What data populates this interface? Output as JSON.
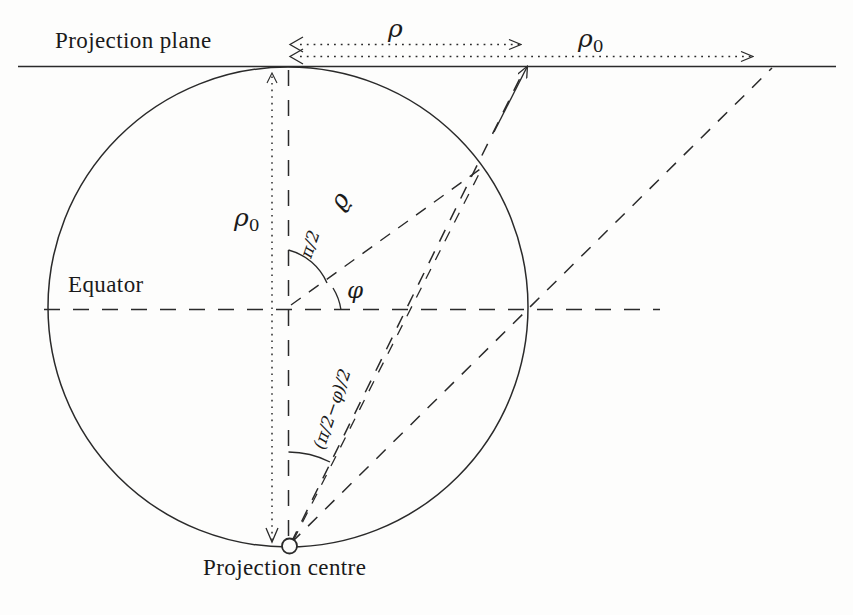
{
  "figure": {
    "labels": {
      "projection_plane": "Projection plane",
      "equator": "Equator",
      "projection_centre": "Projection centre"
    },
    "math_labels": {
      "rho_top": "ρ",
      "rho0_top_base": "ρ",
      "rho0_top_sub": "0",
      "rho0_vertical_base": "ρ",
      "rho0_vertical_sub": "0",
      "varrho_line": "ϱ",
      "half_pi": "π/2",
      "phi": "φ",
      "half_angle": "(π/2−φ)/2"
    },
    "colors": {
      "ink": "#2a2a2a",
      "background": "#fdfdfc"
    },
    "geometry": {
      "plane_y": 66,
      "plane_x_start": 18,
      "plane_x_end": 836,
      "circle_center_x": 288,
      "circle_center_y": 307,
      "circle_radius": 240,
      "equator_y": 309,
      "equator_x_start": 44,
      "equator_x_end": 660,
      "projection_centre_x": 288,
      "projection_centre_y": 546,
      "tangent_point_x": 288,
      "tangent_point_y": 67,
      "circle_point_x": 483,
      "circle_point_y": 166,
      "rho_arrow_x_start": 291,
      "rho_arrow_x_end": 527,
      "rho_arrow_y": 44,
      "rho0_arrow_x_start": 291,
      "rho0_arrow_x_end": 760,
      "rho0_arrow_y": 56,
      "ray_plane_hit_x": 527,
      "equator_ray_plane_hit_x": 772
    }
  }
}
